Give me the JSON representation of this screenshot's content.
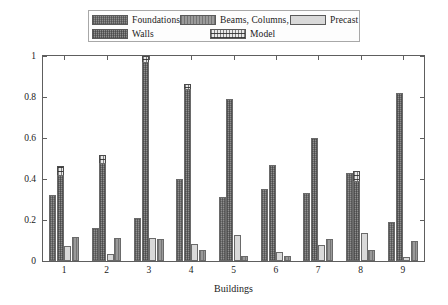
{
  "chart_data": {
    "type": "bar",
    "title": "",
    "xlabel": "Buildings",
    "ylabel": "Unit Weight (tons per m 2)",
    "ylabel_base": "Unit Weight (tons per m ",
    "ylabel_sup": "2",
    "ylabel_close": ")",
    "categories": [
      "1",
      "2",
      "3",
      "4",
      "5",
      "6",
      "7",
      "8",
      "9"
    ],
    "ylim": [
      0,
      1
    ],
    "yticks": [
      0,
      0.2,
      0.4,
      0.6,
      0.8,
      1
    ],
    "ytick_labels": [
      "0",
      "0.2",
      "0.4",
      "0.6",
      "0.8",
      "1"
    ],
    "grid": false,
    "legend_position": "top-center-outside",
    "series": [
      {
        "name": "Foundations",
        "color": "#8e8e8e",
        "pattern": "cross-dot",
        "values": [
          0.32,
          0.16,
          0.21,
          0.4,
          0.31,
          0.35,
          0.33,
          0.43,
          0.19
        ]
      },
      {
        "name": "Walls",
        "color": "#8e8e8e",
        "pattern": "cross-dot",
        "values": [
          0.42,
          0.48,
          0.97,
          0.84,
          0.79,
          0.47,
          0.6,
          0.39,
          0.82
        ]
      },
      {
        "name": "Precast",
        "color": "#d9d9d9",
        "pattern": "solid",
        "values": [
          0.075,
          0.035,
          0.11,
          0.085,
          0.125,
          0.045,
          0.08,
          0.135,
          0.02
        ]
      },
      {
        "name": "Beams, Columns, Slabs",
        "color": "#9a9a9a",
        "pattern": "vertical-line",
        "values": [
          0.115,
          0.11,
          0.105,
          0.055,
          0.025,
          0.025,
          0.105,
          0.055,
          0.1
        ]
      }
    ],
    "model_overlay": {
      "name": "Model",
      "color": "#e8e8e8",
      "pattern": "dotted-hatch",
      "applies_to": "Walls",
      "values": [
        0.465,
        0.515,
        1.0,
        0.865,
        0.65,
        0.415,
        0.485,
        0.44,
        0.72
      ]
    }
  },
  "legend": {
    "entries": [
      {
        "label": "Foundations",
        "swatch": "fill-foundations"
      },
      {
        "label": "Beams, Columns, Slabs",
        "swatch": "fill-beams"
      },
      {
        "label": "Precast",
        "swatch": "fill-precast"
      },
      {
        "label": "Walls",
        "swatch": "fill-walls"
      },
      {
        "label": "Model",
        "swatch": "fill-model"
      }
    ]
  }
}
